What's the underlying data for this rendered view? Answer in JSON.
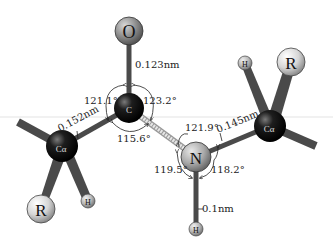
{
  "diagram": {
    "atoms": {
      "O": {
        "label": "O",
        "cx": 129,
        "cy": 31,
        "r": 14,
        "kind": "oxygen"
      },
      "C": {
        "label": "C",
        "cx": 129,
        "cy": 108,
        "r": 15,
        "kind": "carbon"
      },
      "Ca_left": {
        "label": "Cα",
        "cx": 62,
        "cy": 146,
        "r": 16,
        "kind": "carbon"
      },
      "R_left": {
        "label": "R",
        "cx": 41,
        "cy": 209,
        "r": 14,
        "kind": "r-group"
      },
      "H_left": {
        "label": "H",
        "cx": 88,
        "cy": 201,
        "r": 7,
        "kind": "hydrogen"
      },
      "N": {
        "label": "N",
        "cx": 196,
        "cy": 157,
        "r": 15,
        "kind": "nitrogen"
      },
      "H_bottom": {
        "label": "H",
        "cx": 196,
        "cy": 229,
        "r": 7,
        "kind": "hydrogen"
      },
      "Ca_right": {
        "label": "Cα",
        "cx": 270,
        "cy": 126,
        "r": 16,
        "kind": "carbon"
      },
      "H_right": {
        "label": "H",
        "cx": 245,
        "cy": 63,
        "r": 7,
        "kind": "hydrogen"
      },
      "R_right": {
        "label": "R",
        "cx": 291,
        "cy": 62,
        "r": 14,
        "kind": "r-group"
      }
    },
    "bond_lengths": {
      "C_O": "0.123nm",
      "Ca_C": "0.152nm",
      "N_Ca": "0.145nm",
      "N_H": "0.1nm"
    },
    "bond_angles": {
      "O_C_Ca": "121.1°",
      "O_C_N": "123.2°",
      "Ca_C_N": "115.6°",
      "C_N_Ca": "121.9°",
      "C_N_H": "119.5°",
      "Ca_N_H": "118.2°"
    },
    "colors": {
      "carbon": "#111111",
      "oxygen": "#8a8a8a",
      "nitrogen": "#a9a9a9",
      "hydrogen": "#b5b5b5",
      "r_group": "#d6d6d6",
      "bond": "#555555",
      "peptide_bond": "#dcdcdc"
    }
  }
}
